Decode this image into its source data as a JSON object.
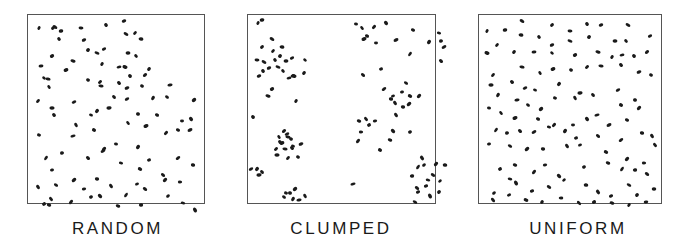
{
  "figure": {
    "dot_color": "#1a1a1a",
    "frame_color": "#555555",
    "panels": [
      {
        "id": "random",
        "label": "RANDOM",
        "frame": {
          "x": 27,
          "y": 14,
          "w": 178,
          "h": 190
        },
        "label_x": 70,
        "label_w": 95,
        "dots": [
          [
            11,
            13
          ],
          [
            33,
            16
          ],
          [
            27,
            12
          ],
          [
            25,
            13
          ],
          [
            53,
            13
          ],
          [
            78,
            10
          ],
          [
            96,
            6
          ],
          [
            98,
            19
          ],
          [
            107,
            18
          ],
          [
            113,
            24
          ],
          [
            31,
            24
          ],
          [
            56,
            25
          ],
          [
            69,
            38
          ],
          [
            60,
            35
          ],
          [
            100,
            38
          ],
          [
            108,
            41
          ],
          [
            76,
            34
          ],
          [
            97,
            52
          ],
          [
            121,
            54
          ],
          [
            13,
            51
          ],
          [
            16,
            63
          ],
          [
            24,
            41
          ],
          [
            45,
            46
          ],
          [
            74,
            49
          ],
          [
            91,
            52
          ],
          [
            102,
            61
          ],
          [
            117,
            60
          ],
          [
            20,
            64
          ],
          [
            21,
            72
          ],
          [
            38,
            55
          ],
          [
            60,
            65
          ],
          [
            72,
            67
          ],
          [
            73,
            71
          ],
          [
            91,
            68
          ],
          [
            99,
            73
          ],
          [
            114,
            71
          ],
          [
            10,
            86
          ],
          [
            24,
            93
          ],
          [
            26,
            100
          ],
          [
            46,
            87
          ],
          [
            63,
            100
          ],
          [
            69,
            96
          ],
          [
            81,
            93
          ],
          [
            86,
            82
          ],
          [
            99,
            84
          ],
          [
            110,
            99
          ],
          [
            125,
            83
          ],
          [
            142,
            70
          ],
          [
            139,
            82
          ],
          [
            166,
            85
          ],
          [
            11,
            120
          ],
          [
            48,
            110
          ],
          [
            45,
            121
          ],
          [
            66,
            115
          ],
          [
            76,
            134
          ],
          [
            88,
            129
          ],
          [
            100,
            108
          ],
          [
            118,
            111
          ],
          [
            129,
            100
          ],
          [
            138,
            118
          ],
          [
            154,
            106
          ],
          [
            163,
            104
          ],
          [
            162,
            115
          ],
          [
            150,
            115
          ],
          [
            18,
            143
          ],
          [
            34,
            138
          ],
          [
            60,
            143
          ],
          [
            75,
            136
          ],
          [
            93,
            148
          ],
          [
            110,
            132
          ],
          [
            121,
            145
          ],
          [
            135,
            160
          ],
          [
            150,
            143
          ],
          [
            165,
            150
          ],
          [
            10,
            172
          ],
          [
            24,
            155
          ],
          [
            28,
            170
          ],
          [
            46,
            165
          ],
          [
            69,
            164
          ],
          [
            83,
            171
          ],
          [
            109,
            169
          ],
          [
            112,
            154
          ],
          [
            137,
            165
          ],
          [
            152,
            167
          ],
          [
            23,
            184
          ],
          [
            16,
            189
          ],
          [
            21,
            190
          ],
          [
            43,
            187
          ],
          [
            56,
            174
          ],
          [
            72,
            181
          ],
          [
            63,
            182
          ],
          [
            90,
            191
          ],
          [
            98,
            180
          ],
          [
            113,
            190
          ],
          [
            117,
            174
          ],
          [
            140,
            181
          ],
          [
            155,
            188
          ],
          [
            167,
            195
          ]
        ]
      },
      {
        "id": "clumped",
        "label": "CLUMPED",
        "frame": {
          "x": 247,
          "y": 14,
          "w": 189,
          "h": 190
        },
        "label_x": 288,
        "label_w": 106,
        "dots": [
          [
            10,
            8
          ],
          [
            14,
            5
          ],
          [
            24,
            24
          ],
          [
            14,
            32
          ],
          [
            9,
            45
          ],
          [
            15,
            56
          ],
          [
            11,
            61
          ],
          [
            16,
            47
          ],
          [
            25,
            36
          ],
          [
            34,
            32
          ],
          [
            27,
            45
          ],
          [
            21,
            53
          ],
          [
            30,
            52
          ],
          [
            32,
            41
          ],
          [
            38,
            46
          ],
          [
            35,
            56
          ],
          [
            44,
            43
          ],
          [
            46,
            61
          ],
          [
            56,
            58
          ],
          [
            45,
            61
          ],
          [
            57,
            45
          ],
          [
            24,
            74
          ],
          [
            20,
            81
          ],
          [
            48,
            86
          ],
          [
            41,
            63
          ],
          [
            5,
            102
          ],
          [
            36,
            116
          ],
          [
            40,
            122
          ],
          [
            31,
            122
          ],
          [
            34,
            128
          ],
          [
            43,
            124
          ],
          [
            28,
            134
          ],
          [
            37,
            134
          ],
          [
            44,
            133
          ],
          [
            53,
            129
          ],
          [
            50,
            142
          ],
          [
            40,
            143
          ],
          [
            29,
            140
          ],
          [
            32,
            127
          ],
          [
            39,
            119
          ],
          [
            45,
            131
          ],
          [
            9,
            154
          ],
          [
            11,
            160
          ],
          [
            14,
            157
          ],
          [
            3,
            154
          ],
          [
            42,
            178
          ],
          [
            45,
            184
          ],
          [
            51,
            185
          ],
          [
            36,
            182
          ],
          [
            47,
            174
          ],
          [
            38,
            178
          ],
          [
            57,
            181
          ],
          [
            105,
            169
          ],
          [
            132,
            135
          ],
          [
            188,
            149
          ],
          [
            108,
            9
          ],
          [
            114,
            13
          ],
          [
            116,
            24
          ],
          [
            119,
            21
          ],
          [
            126,
            12
          ],
          [
            128,
            28
          ],
          [
            138,
            8
          ],
          [
            148,
            25
          ],
          [
            165,
            15
          ],
          [
            162,
            39
          ],
          [
            193,
            26
          ],
          [
            193,
            46
          ],
          [
            196,
            32
          ],
          [
            191,
            18
          ],
          [
            181,
            27
          ],
          [
            133,
            54
          ],
          [
            115,
            60
          ],
          [
            136,
            74
          ],
          [
            143,
            84
          ],
          [
            147,
            88
          ],
          [
            154,
            77
          ],
          [
            158,
            68
          ],
          [
            161,
            89
          ],
          [
            155,
            92
          ],
          [
            148,
            100
          ],
          [
            145,
            81
          ],
          [
            162,
            81
          ],
          [
            171,
            81
          ],
          [
            113,
            117
          ],
          [
            118,
            104
          ],
          [
            121,
            110
          ],
          [
            111,
            106
          ],
          [
            110,
            126
          ],
          [
            127,
            106
          ],
          [
            145,
            116
          ],
          [
            162,
            117
          ],
          [
            142,
            125
          ],
          [
            170,
            152
          ],
          [
            164,
            161
          ],
          [
            169,
            173
          ],
          [
            176,
            150
          ],
          [
            180,
            165
          ],
          [
            182,
            181
          ],
          [
            178,
            171
          ],
          [
            185,
            160
          ],
          [
            192,
            166
          ],
          [
            197,
            150
          ],
          [
            174,
            143
          ],
          [
            170,
            177
          ],
          [
            167,
            187
          ],
          [
            191,
            177
          ]
        ]
      },
      {
        "id": "uniform",
        "label": "UNIFORM",
        "frame": {
          "x": 478,
          "y": 14,
          "w": 184,
          "h": 190
        },
        "label_x": 524,
        "label_w": 108,
        "dots": [
          [
            8,
            16
          ],
          [
            26,
            15
          ],
          [
            43,
            6
          ],
          [
            73,
            10
          ],
          [
            91,
            16
          ],
          [
            108,
            9
          ],
          [
            122,
            10
          ],
          [
            149,
            10
          ],
          [
            18,
            30
          ],
          [
            42,
            20
          ],
          [
            60,
            22
          ],
          [
            73,
            30
          ],
          [
            91,
            26
          ],
          [
            110,
            22
          ],
          [
            136,
            26
          ],
          [
            147,
            26
          ],
          [
            171,
            21
          ],
          [
            8,
            38
          ],
          [
            35,
            37
          ],
          [
            55,
            37
          ],
          [
            73,
            38
          ],
          [
            96,
            40
          ],
          [
            119,
            37
          ],
          [
            133,
            42
          ],
          [
            143,
            40
          ],
          [
            155,
            41
          ],
          [
            168,
            37
          ],
          [
            43,
            52
          ],
          [
            61,
            58
          ],
          [
            74,
            54
          ],
          [
            92,
            55
          ],
          [
            108,
            52
          ],
          [
            122,
            51
          ],
          [
            142,
            50
          ],
          [
            160,
            57
          ],
          [
            172,
            60
          ],
          [
            14,
            60
          ],
          [
            12,
            70
          ],
          [
            33,
            67
          ],
          [
            46,
            73
          ],
          [
            56,
            75
          ],
          [
            80,
            69
          ],
          [
            101,
            78
          ],
          [
            114,
            80
          ],
          [
            139,
            75
          ],
          [
            156,
            85
          ],
          [
            19,
            80
          ],
          [
            38,
            85
          ],
          [
            49,
            90
          ],
          [
            62,
            94
          ],
          [
            76,
            83
          ],
          [
            96,
            83
          ],
          [
            118,
            100
          ],
          [
            142,
            90
          ],
          [
            160,
            93
          ],
          [
            10,
            93
          ],
          [
            22,
            98
          ],
          [
            36,
            103
          ],
          [
            59,
            104
          ],
          [
            75,
            110
          ],
          [
            94,
            110
          ],
          [
            108,
            104
          ],
          [
            130,
            110
          ],
          [
            148,
            105
          ],
          [
            17,
            115
          ],
          [
            28,
            118
          ],
          [
            41,
            116
          ],
          [
            55,
            117
          ],
          [
            70,
            112
          ],
          [
            86,
            116
          ],
          [
            97,
            123
          ],
          [
            119,
            121
          ],
          [
            142,
            125
          ],
          [
            163,
            118
          ],
          [
            173,
            121
          ],
          [
            10,
            129
          ],
          [
            31,
            131
          ],
          [
            48,
            134
          ],
          [
            64,
            134
          ],
          [
            88,
            131
          ],
          [
            101,
            130
          ],
          [
            127,
            137
          ],
          [
            148,
            144
          ],
          [
            165,
            148
          ],
          [
            176,
            130
          ],
          [
            21,
            154
          ],
          [
            36,
            150
          ],
          [
            55,
            157
          ],
          [
            66,
            150
          ],
          [
            80,
            161
          ],
          [
            105,
            152
          ],
          [
            129,
            148
          ],
          [
            143,
            154
          ],
          [
            156,
            155
          ],
          [
            168,
            159
          ],
          [
            15,
            178
          ],
          [
            31,
            164
          ],
          [
            37,
            168
          ],
          [
            53,
            176
          ],
          [
            70,
            172
          ],
          [
            85,
            165
          ],
          [
            107,
            170
          ],
          [
            119,
            177
          ],
          [
            132,
            181
          ],
          [
            150,
            170
          ],
          [
            158,
            180
          ],
          [
            175,
            174
          ],
          [
            14,
            185
          ],
          [
            30,
            180
          ],
          [
            47,
            185
          ],
          [
            63,
            187
          ],
          [
            82,
            183
          ],
          [
            100,
            188
          ],
          [
            115,
            187
          ],
          [
            133,
            188
          ],
          [
            150,
            190
          ],
          [
            167,
            187
          ]
        ]
      }
    ]
  }
}
